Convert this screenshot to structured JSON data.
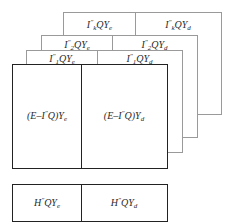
{
  "diagram": {
    "layers": [
      {
        "id": "layer-k",
        "left": {
          "base": "I",
          "sup": "\"",
          "sub": "k",
          "rest": "QY",
          "rest_sub": "e"
        },
        "right": {
          "base": "I",
          "sup": "\"",
          "sub": "k",
          "rest": "QY",
          "rest_sub": "d"
        }
      },
      {
        "id": "layer-2",
        "left": {
          "base": "I",
          "sup": "\"",
          "sub": "2",
          "rest": "QY",
          "rest_sub": "e"
        },
        "right": {
          "base": "I",
          "sup": "\"",
          "sub": "2",
          "rest": "QY",
          "rest_sub": "d"
        }
      },
      {
        "id": "layer-1",
        "left": {
          "base": "I",
          "sup": "\"",
          "sub": "1",
          "rest": "QY",
          "rest_sub": "e"
        },
        "right": {
          "base": "I",
          "sup": "\"",
          "sub": "1",
          "rest": "QY",
          "rest_sub": "d"
        }
      }
    ],
    "main_block": {
      "left": {
        "prefix": "(E–I",
        "sup": "\"",
        "mid": "Q)Y",
        "sub": "e"
      },
      "right": {
        "prefix": "(E–I",
        "sup": "\"",
        "mid": "Q)Y",
        "sub": "d"
      }
    },
    "bottom_block": {
      "left": {
        "base": "H",
        "sup": "\"",
        "rest": "QY",
        "sub": "e"
      },
      "right": {
        "base": "H",
        "sup": "\"",
        "rest": "QY",
        "sub": "d"
      }
    }
  }
}
